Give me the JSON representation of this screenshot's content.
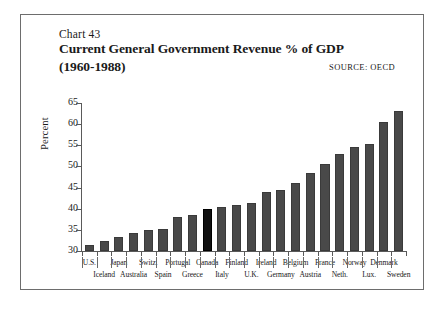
{
  "heading": {
    "chart_number": "Chart 43",
    "title": "Current General Government Revenue % of GDP",
    "period": "(1960-1988)",
    "source": "SOURCE:  OECD"
  },
  "axis": {
    "y_title": "Percent",
    "y_ticks": [
      "65",
      "60",
      "55",
      "50",
      "45",
      "40",
      "35",
      "30"
    ]
  },
  "chart_data": {
    "type": "bar",
    "title": "Current General Government Revenue % of GDP (1960-1988)",
    "subtitle": "Chart 43",
    "source": "OECD",
    "xlabel": "",
    "ylabel": "Percent",
    "ylim": [
      30,
      65
    ],
    "ytick_step": 5,
    "grid": false,
    "legend": null,
    "highlight_category": "Canada",
    "bar_color": "#494949",
    "highlight_color": "#111111",
    "categories": [
      "U.S.",
      "Iceland",
      "Japan",
      "Australia",
      "Switz.",
      "Spain",
      "Portugal",
      "Greece",
      "Canada",
      "Italy",
      "Finland",
      "U.K.",
      "Ireland",
      "Germany",
      "Belgium",
      "Austria",
      "France",
      "Neth.",
      "Norway",
      "Lux.",
      "Denmark",
      "Sweden"
    ],
    "values": [
      31.5,
      32.4,
      33.3,
      34.3,
      35.0,
      35.2,
      38.0,
      38.4,
      40.0,
      40.3,
      41.0,
      41.3,
      44.0,
      44.5,
      46.2,
      48.5,
      50.5,
      53.0,
      54.7,
      55.2,
      60.6,
      63.0
    ],
    "label_rows": [
      "top",
      "bottom",
      "top",
      "bottom",
      "top",
      "bottom",
      "top",
      "bottom",
      "top",
      "bottom",
      "top",
      "bottom",
      "top",
      "bottom",
      "top",
      "bottom",
      "top",
      "bottom",
      "top",
      "bottom",
      "top",
      "bottom"
    ]
  }
}
